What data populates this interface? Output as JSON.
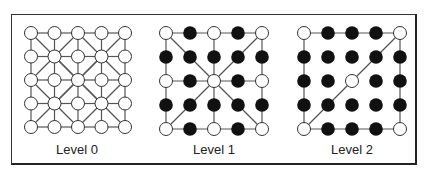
{
  "diagram": {
    "grid_size": 5,
    "colors": {
      "line": "#555555",
      "node_open_fill": "#ffffff",
      "node_stroke": "#333333",
      "node_filled": "#111111"
    },
    "levels": [
      {
        "label": "Level 0",
        "nodes": [
          "ooooo",
          "ooooo",
          "ooooo",
          "ooooo",
          "ooooo"
        ],
        "edges": "full-grid-with-diagonals"
      },
      {
        "label": "Level 1",
        "nodes": [
          "o*o*o",
          "*****",
          "o*o*o",
          "*****",
          "o*o*o"
        ],
        "edges": "border-cross-and-center-diagonals"
      },
      {
        "label": "Level 2",
        "nodes": [
          "o***o",
          "*****",
          "**o**",
          "*****",
          "o***o"
        ],
        "edges": "border-and-single-diagonal"
      }
    ]
  }
}
